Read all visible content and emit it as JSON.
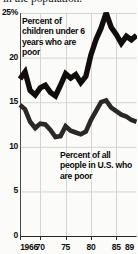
{
  "caption": {
    "clipped_line": "in the population."
  },
  "chart_data": {
    "type": "line",
    "title": "",
    "subtitle": "",
    "xlabel": "",
    "ylabel": "",
    "grid": true,
    "legend_position": "inline-annotations",
    "xlim": [
      1966,
      1989
    ],
    "ylim": [
      0,
      25
    ],
    "ytick_labels": [
      "25%",
      "20",
      "15",
      "10",
      "5",
      "0"
    ],
    "ytick_values": [
      25,
      20,
      15,
      10,
      5,
      0
    ],
    "xtick_labels": [
      "1966",
      "70",
      "75",
      "80",
      "85",
      "89"
    ],
    "xtick_values": [
      1966,
      1970,
      1975,
      1980,
      1985,
      1989
    ],
    "x": [
      1966,
      1967,
      1968,
      1969,
      1970,
      1971,
      1972,
      1973,
      1974,
      1975,
      1976,
      1977,
      1978,
      1979,
      1980,
      1981,
      1982,
      1983,
      1984,
      1985,
      1986,
      1987,
      1988,
      1989
    ],
    "series": [
      {
        "name": "Percent of children under 6 years who are poor",
        "color": "#100d0b",
        "values": [
          17.6,
          18.4,
          16.3,
          15.8,
          16.6,
          16.9,
          16.1,
          15.7,
          16.9,
          18.2,
          17.7,
          18.1,
          17.2,
          17.9,
          20.3,
          22.0,
          23.3,
          25.0,
          23.4,
          22.6,
          21.6,
          22.4,
          22.0,
          22.5
        ]
      },
      {
        "name": "Percent of all people in U.S. who are poor",
        "color": "#2a2724",
        "values": [
          14.7,
          14.2,
          12.8,
          12.1,
          12.6,
          12.5,
          11.9,
          11.1,
          11.2,
          12.3,
          11.8,
          11.6,
          11.4,
          11.7,
          13.0,
          14.0,
          15.0,
          15.2,
          14.4,
          14.0,
          13.6,
          13.4,
          13.0,
          12.8
        ]
      }
    ],
    "annotations": [
      {
        "id": "annot-children",
        "text": "Percent of children under 6 years who are poor"
      },
      {
        "id": "annot-all",
        "text": "Percent of all people in U.S. who are poor"
      }
    ]
  }
}
